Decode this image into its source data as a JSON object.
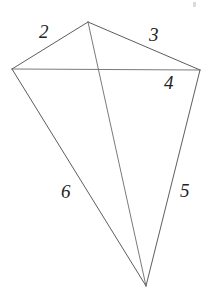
{
  "figure": {
    "background_color": "#ffffff",
    "stroke_color": "#4a4a4a",
    "label_color": "#232323",
    "canvas": {
      "width": 218,
      "height": 294
    },
    "vertices": [
      {
        "name": "top",
        "x": 88,
        "y": 22
      },
      {
        "name": "left",
        "x": 12,
        "y": 69
      },
      {
        "name": "right",
        "x": 200,
        "y": 70
      },
      {
        "name": "bottom",
        "x": 146,
        "y": 286
      }
    ],
    "edges": [
      {
        "name": "top-left-edge",
        "from": "left",
        "to": "top",
        "path": "M 12 69 L 88 22"
      },
      {
        "name": "top-right-edge",
        "from": "top",
        "to": "right",
        "path": "M 88 22 L 200 70"
      },
      {
        "name": "left-bottom-edge",
        "from": "left",
        "to": "bottom",
        "path": "M 12 69 L 146 286"
      },
      {
        "name": "right-bottom-edge",
        "from": "right",
        "to": "bottom",
        "path": "M 200 70 L 146 286"
      },
      {
        "name": "horizontal-diagonal",
        "from": "left",
        "to": "right",
        "path": "M 12 69 L 200 70"
      },
      {
        "name": "vertical-diagonal",
        "from": "top",
        "to": "bottom",
        "path": "M 88 22 L 146 286"
      }
    ],
    "labels": [
      {
        "id": "label-2",
        "text": "2",
        "x": 39,
        "y": 22,
        "for_edge": "top-left-edge"
      },
      {
        "id": "label-3",
        "text": "3",
        "x": 149,
        "y": 25,
        "for_edge": "top-right-edge"
      },
      {
        "id": "label-4",
        "text": "4",
        "x": 164,
        "y": 73,
        "for_edge": "horizontal-diagonal"
      },
      {
        "id": "label-5",
        "text": "5",
        "x": 180,
        "y": 181,
        "for_edge": "right-bottom-edge"
      },
      {
        "id": "label-6",
        "text": "6",
        "x": 61,
        "y": 182,
        "for_edge": "left-bottom-edge"
      }
    ],
    "artifacts": [
      {
        "id": "speck-top-right",
        "x": 193,
        "y": 2
      }
    ]
  }
}
